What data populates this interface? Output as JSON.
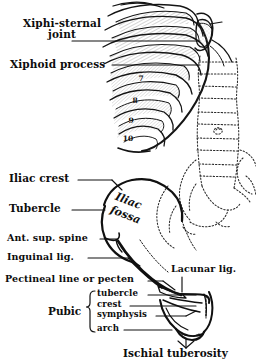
{
  "figure": {
    "kind": "anatomical-line-drawing",
    "background_color": "#ffffff",
    "ink_color": "#111111",
    "shading_color": "#9a9a9a"
  },
  "thorax": {
    "labels": [
      {
        "id": "xiphi-sternal-joint",
        "text_line1": "Xiphi-sternal",
        "text_line2": "joint"
      },
      {
        "id": "xiphoid-process",
        "text": "Xiphoid process"
      }
    ],
    "rib_numbers": [
      "7",
      "8",
      "9",
      "10"
    ]
  },
  "pelvis": {
    "left_labels": [
      {
        "id": "iliac-crest",
        "text": "Iliac crest"
      },
      {
        "id": "tubercle",
        "text": "Tubercle"
      },
      {
        "id": "ant-sup-spine",
        "text": "Ant. sup. spine"
      },
      {
        "id": "inguinal-lig",
        "text": "Inguinal lig."
      },
      {
        "id": "pectineal-line",
        "text": "Pectineal line or pecten"
      }
    ],
    "inner_label": {
      "id": "iliac-fossa",
      "line1": "Iliac",
      "line2": "fossa"
    },
    "right_label": {
      "id": "lacunar-lig",
      "text": "Lacunar lig."
    },
    "pubic_group": {
      "group_label": "Pubic",
      "items": [
        {
          "id": "pubic-tubercle",
          "text": "tubercle"
        },
        {
          "id": "pubic-crest",
          "text": "crest"
        },
        {
          "id": "pubic-symphysis",
          "text": "symphysis"
        },
        {
          "id": "pubic-arch",
          "text": "arch"
        }
      ]
    },
    "bottom_label": {
      "id": "ischial-tuberosity",
      "text": "Ischial tuberosity"
    }
  }
}
